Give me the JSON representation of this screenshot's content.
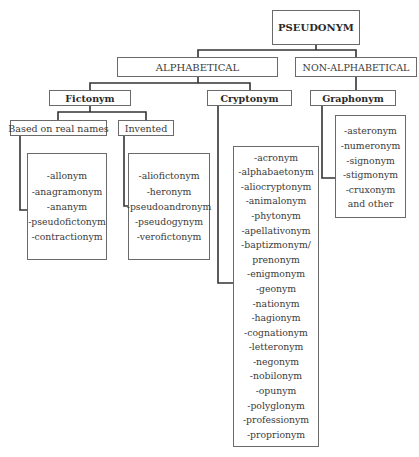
{
  "root": {
    "label": "PSEUDONYM"
  },
  "categories": [
    {
      "label": "ALPHABETICAL"
    },
    {
      "label": "NON-ALPHABETICAL"
    }
  ],
  "types": [
    {
      "label": "Fictonym"
    },
    {
      "label": "Cryptonym"
    },
    {
      "label": "Graphonym"
    }
  ],
  "fictonym_subtypes": [
    {
      "label": "Based on real names"
    },
    {
      "label": "Invented"
    }
  ],
  "lists": {
    "based_on_real_names": [
      "-allonym",
      "-anagramonym",
      "-ananym",
      "-pseudofictonym",
      "-contractionym"
    ],
    "invented": [
      "-aliofictonym",
      "-heronym",
      "-pseudoandronym",
      "-pseudogynym",
      "-verofictonym"
    ],
    "cryptonym": [
      "-acronym",
      "-alphabaetonym",
      "-aliocryptonym",
      "-animalonym",
      "-phytonym",
      "-apellativonym",
      "-baptizmonym/",
      "prenonym",
      "-enigmonym",
      "-geonym",
      "-nationym",
      "-hagionym",
      "-cognationym",
      "-letteronym",
      "-negonym",
      "-nobilonym",
      "-opunym",
      "-polyglonym",
      "-professionym",
      "-proprionym"
    ],
    "graphonym": [
      "-asteronym",
      "-numeronym",
      "-signonym",
      "-stigmonym",
      "-cruxonym",
      "and other"
    ]
  }
}
